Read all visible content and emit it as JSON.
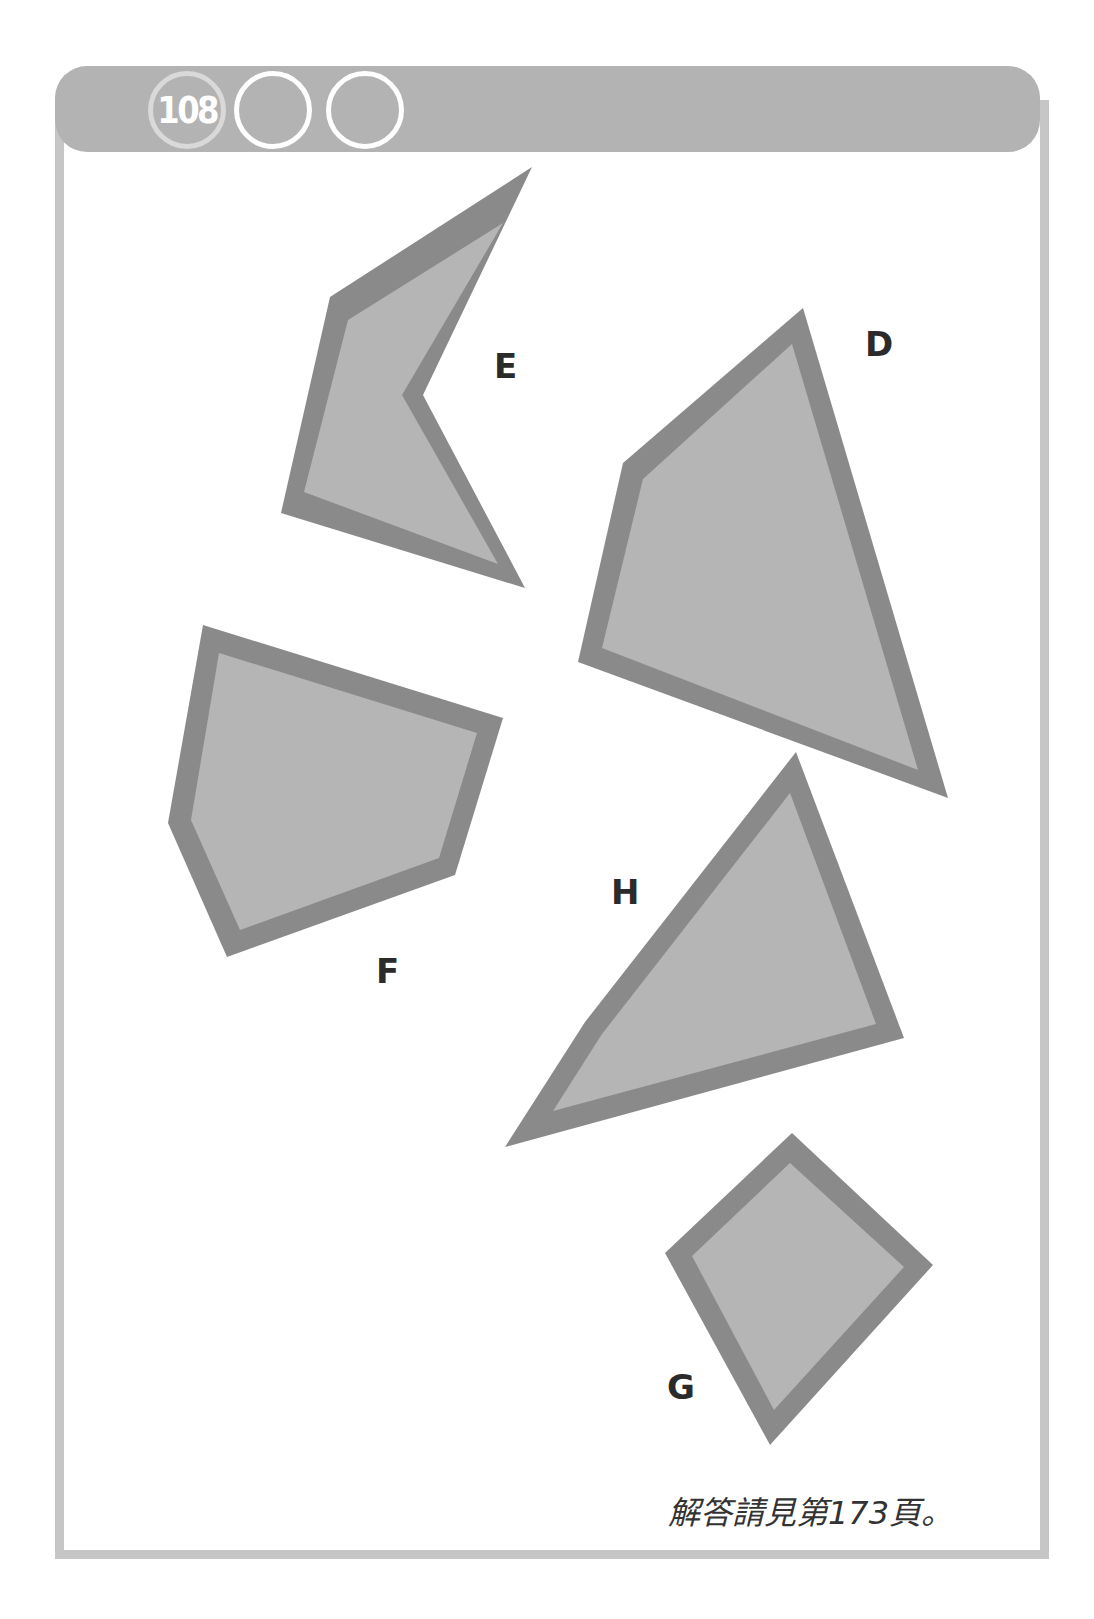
{
  "header": {
    "puzzle_number": "108",
    "difficulty_circles": [
      "108",
      "",
      ""
    ]
  },
  "shapes": [
    {
      "label": "E",
      "outer": "532,167 330,297 281,513 525,588 423,395",
      "inner": "503,223 348,320 304,492 498,564 402,395"
    },
    {
      "label": "D",
      "outer": "803,308 623,463 578,662 948,798",
      "inner": "792,344 643,479 602,648 918,770"
    },
    {
      "label": "F",
      "outer": "203,625 503,718 455,875 227,957 168,823",
      "inner": "219,653 477,733 439,858 240,930 191,820"
    },
    {
      "label": "H",
      "outer": "796,752 904,1038 505,1147 585,1022",
      "inner": "790,793 876,1024 553,1111 602,1034"
    },
    {
      "label": "G",
      "outer": "792,1133 933,1265 770,1445 665,1253",
      "inner": "790,1163 904,1267 774,1410 692,1256"
    }
  ],
  "labels": {
    "E": "E",
    "D": "D",
    "F": "F",
    "H": "H",
    "G": "G"
  },
  "footer": {
    "answer_note": "解答請見第173頁。"
  },
  "colors": {
    "shape_fill": "#b5b5b5",
    "shape_border": "#8a8a8a",
    "header": "#b3b3b3",
    "frame": "#c6c6c6"
  }
}
